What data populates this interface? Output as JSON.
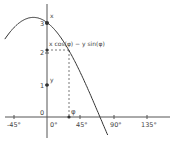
{
  "chart_data": {
    "type": "line",
    "title": "",
    "xlabel": "",
    "ylabel": "",
    "function": "x cos(φ) − y sin(φ)",
    "params": {
      "x": 3,
      "y": 1,
      "phi_deg": 30
    },
    "x_ticks": [
      "-45°",
      "0°",
      "45°",
      "90°",
      "135°"
    ],
    "y_ticks": [
      "0",
      "1",
      "2",
      "3"
    ],
    "xlim": [
      -60,
      150
    ],
    "ylim": [
      -0.9,
      3.5
    ],
    "grid": false,
    "series": [
      {
        "name": "x cos(φ) − y sin(φ)",
        "x": [
          -57,
          -45,
          -30,
          -18.4,
          0,
          15,
          30,
          45,
          60,
          71.6,
          82
        ],
        "values": [
          1.47,
          2.83,
          3.1,
          3.16,
          3.0,
          2.64,
          2.1,
          1.41,
          0.63,
          0.0,
          -0.57
        ]
      }
    ],
    "annotations": [
      {
        "label": "x",
        "at": [
          0,
          3
        ]
      },
      {
        "label": "y",
        "at": [
          0,
          1
        ]
      },
      {
        "label": "φ",
        "at": [
          30,
          0
        ]
      },
      {
        "label": "x cos(φ) − y sin(φ)",
        "at": [
          0,
          2.1
        ]
      }
    ]
  },
  "labels": {
    "x_point": "x",
    "y_point": "y",
    "phi": "φ",
    "expr": "x cos(φ) − y sin(φ)",
    "tick_neg45": "-45°",
    "tick_0": "0°",
    "tick_45": "45°",
    "tick_90": "90°",
    "tick_135": "135°",
    "y0": "0",
    "y1": "1",
    "y2": "2",
    "y3": "3"
  }
}
